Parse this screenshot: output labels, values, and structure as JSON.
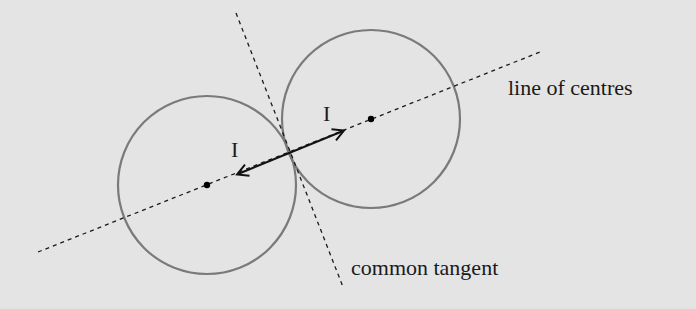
{
  "diagram": {
    "colors": {
      "background": "#e4e4e4",
      "circle": "#7a7a7a",
      "line": "#1a1a1a",
      "arrow": "#111111"
    },
    "circles": [
      {
        "name": "left-circle",
        "cx": 207,
        "cy": 185,
        "r": 89
      },
      {
        "name": "right-circle",
        "cx": 371,
        "cy": 119,
        "r": 89
      }
    ],
    "line_of_centres": {
      "x1": 38,
      "y1": 252,
      "x2": 540,
      "y2": 52
    },
    "common_tangent": {
      "x1": 236,
      "y1": 13,
      "x2": 343,
      "y2": 287
    },
    "impulse_arrow": {
      "x1": 236,
      "y1": 175,
      "x2": 345,
      "y2": 130
    },
    "labels": {
      "impulse_left": "I",
      "impulse_right": "I",
      "line_of_centres": "line of centres",
      "common_tangent": "common tangent"
    }
  }
}
